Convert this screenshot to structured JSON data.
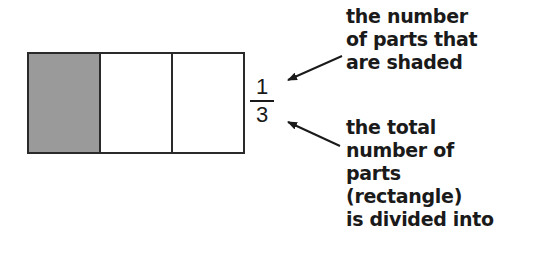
{
  "diagram": {
    "rectangle": {
      "parts_total": 3,
      "parts_shaded": 1,
      "colors": {
        "shaded": "#9a9a9a",
        "unshaded": "#ffffff",
        "outline": "#2a2a2a"
      }
    },
    "fraction": {
      "numerator": "1",
      "denominator": "3"
    },
    "annotations": {
      "numerator_label": "the number\nof parts that\nare shaded",
      "denominator_label": "the total\nnumber of\nparts\n(rectangle)\nis divided into"
    }
  }
}
